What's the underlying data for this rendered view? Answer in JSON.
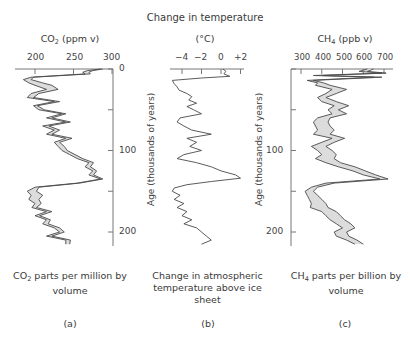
{
  "header": {
    "title": "Change in temperature"
  },
  "panels": [
    {
      "id": "a",
      "axis_title_main": "CO",
      "axis_title_sub": "2",
      "axis_title_rest": " (ppm v)",
      "ticks": [
        "200",
        "250",
        "300"
      ],
      "caption_main": "CO",
      "caption_sub": "2",
      "caption_rest": " parts per million by volume",
      "letter": "(a)"
    },
    {
      "id": "b",
      "axis_title_main": "(°C)",
      "ticks": [
        "−4",
        "−2",
        "0",
        "+2"
      ],
      "caption_main": "Change in atmospheric temperature above ice sheet",
      "letter": "(b)"
    },
    {
      "id": "c",
      "axis_title_main": "CH",
      "axis_title_sub": "4",
      "axis_title_rest": " (ppb v)",
      "ticks": [
        "300",
        "400",
        "500",
        "600",
        "700"
      ],
      "caption_main": "CH",
      "caption_sub": "4",
      "caption_rest": " parts per billion by volume",
      "letter": "(c)"
    }
  ],
  "age_axis": {
    "label": "Age (thousands of years)",
    "ticks": [
      "0",
      "100",
      "200"
    ]
  },
  "colors": {
    "line": "#4a4a4a",
    "band_fill": "#dcdcdc",
    "axis": "#777777"
  },
  "chart_data": [
    {
      "type": "line",
      "title": "CO2 (ppm v)",
      "xlabel": "CO2 parts per million by volume",
      "ylabel": "Age (thousands of years)",
      "xlim": [
        170,
        300
      ],
      "ylim": [
        220,
        0
      ],
      "x_ticks": [
        200,
        250,
        300
      ],
      "y_ticks": [
        0,
        50,
        100,
        150,
        200
      ],
      "series": [
        {
          "name": "CO2 lower",
          "age": [
            0,
            2,
            4,
            6,
            10,
            13,
            17,
            20,
            25,
            30,
            35,
            40,
            45,
            50,
            55,
            60,
            65,
            70,
            75,
            80,
            85,
            90,
            95,
            100,
            105,
            110,
            115,
            120,
            125,
            130,
            135,
            140,
            145,
            150,
            155,
            160,
            165,
            170,
            175,
            180,
            185,
            190,
            195,
            200,
            205,
            210,
            215
          ],
          "values": [
            285,
            268,
            262,
            265,
            195,
            185,
            192,
            200,
            215,
            195,
            190,
            225,
            198,
            205,
            235,
            215,
            240,
            210,
            225,
            215,
            240,
            225,
            230,
            235,
            245,
            255,
            270,
            265,
            275,
            270,
            285,
            255,
            200,
            190,
            195,
            192,
            200,
            196,
            215,
            200,
            215,
            210,
            225,
            232,
            215,
            240,
            240
          ]
        },
        {
          "name": "CO2 upper",
          "age": [
            0,
            2,
            4,
            6,
            10,
            13,
            17,
            20,
            25,
            30,
            35,
            40,
            45,
            50,
            55,
            60,
            65,
            70,
            75,
            80,
            85,
            90,
            95,
            100,
            105,
            110,
            115,
            120,
            125,
            130,
            135,
            140,
            145,
            150,
            155,
            160,
            165,
            170,
            175,
            180,
            185,
            190,
            195,
            200,
            205,
            210,
            215
          ],
          "values": [
            288,
            275,
            270,
            272,
            198,
            195,
            210,
            222,
            230,
            205,
            198,
            232,
            203,
            212,
            240,
            222,
            246,
            218,
            232,
            222,
            248,
            232,
            238,
            242,
            252,
            262,
            276,
            272,
            280,
            276,
            288,
            258,
            205,
            202,
            210,
            205,
            208,
            202,
            222,
            206,
            220,
            217,
            232,
            238,
            222,
            246,
            245
          ]
        }
      ]
    },
    {
      "type": "line",
      "title": "Change in temperature (°C)",
      "xlabel": "Change in atmospheric temperature above ice sheet",
      "ylabel": "Age (thousands of years)",
      "xlim": [
        -5,
        2.5
      ],
      "ylim": [
        220,
        0
      ],
      "x_ticks": [
        -4,
        -2,
        0,
        2
      ],
      "y_ticks": [
        0,
        50,
        100,
        150,
        200
      ],
      "series": [
        {
          "name": "Temperature change",
          "age": [
            0,
            3,
            6,
            9,
            11,
            14,
            18,
            22,
            26,
            30,
            34,
            38,
            42,
            46,
            50,
            55,
            60,
            65,
            70,
            75,
            80,
            85,
            90,
            95,
            100,
            105,
            110,
            115,
            120,
            125,
            130,
            134,
            138,
            142,
            146,
            150,
            155,
            160,
            165,
            170,
            175,
            180,
            185,
            190,
            195,
            200,
            205,
            210,
            215
          ],
          "values": [
            0.2,
            0.5,
            0.3,
            0.9,
            -2.0,
            -5.0,
            -4.8,
            -4.5,
            -4.3,
            -3.5,
            -3.0,
            -3.3,
            -2.5,
            -3.5,
            -2.8,
            -2.0,
            -4.2,
            -4.5,
            -3.8,
            -3.0,
            -1.0,
            -3.5,
            -2.5,
            -3.2,
            -2.0,
            -3.8,
            -4.5,
            -2.5,
            -1.0,
            0.0,
            1.5,
            2.0,
            -1.0,
            -3.5,
            -4.8,
            -5.0,
            -4.2,
            -4.8,
            -3.8,
            -4.5,
            -3.5,
            -4.0,
            -3.0,
            -3.8,
            -2.5,
            -2.0,
            -1.5,
            -1.0,
            -2.0
          ]
        }
      ]
    },
    {
      "type": "line",
      "title": "CH4 (ppb v)",
      "xlabel": "CH4 parts per billion by volume",
      "ylabel": "Age (thousands of years)",
      "xlim": [
        250,
        740
      ],
      "ylim": [
        220,
        0
      ],
      "x_ticks": [
        300,
        400,
        500,
        600,
        700
      ],
      "y_ticks": [
        0,
        50,
        100,
        150,
        200
      ],
      "series": [
        {
          "name": "CH4 lower",
          "age": [
            0,
            3,
            5,
            8,
            10,
            14,
            17,
            20,
            25,
            30,
            35,
            40,
            45,
            50,
            55,
            60,
            65,
            70,
            75,
            80,
            85,
            90,
            95,
            100,
            105,
            110,
            115,
            120,
            125,
            130,
            135,
            140,
            145,
            150,
            155,
            160,
            165,
            170,
            175,
            180,
            185,
            190,
            195,
            200,
            205,
            210,
            215
          ],
          "values": [
            620,
            580,
            690,
            360,
            650,
            330,
            380,
            370,
            450,
            420,
            380,
            400,
            460,
            430,
            450,
            380,
            360,
            370,
            380,
            360,
            450,
            400,
            350,
            380,
            400,
            370,
            420,
            480,
            550,
            600,
            680,
            420,
            350,
            320,
            330,
            340,
            350,
            345,
            400,
            420,
            440,
            470,
            500,
            460,
            470,
            520,
            560
          ]
        },
        {
          "name": "CH4 upper",
          "age": [
            0,
            3,
            5,
            8,
            10,
            14,
            17,
            20,
            25,
            30,
            35,
            40,
            45,
            50,
            55,
            60,
            65,
            70,
            75,
            80,
            85,
            90,
            95,
            100,
            105,
            110,
            115,
            120,
            125,
            130,
            135,
            140,
            145,
            150,
            155,
            160,
            165,
            170,
            175,
            180,
            185,
            190,
            195,
            200,
            205,
            210,
            215
          ],
          "values": [
            650,
            620,
            710,
            400,
            690,
            360,
            410,
            440,
            520,
            470,
            420,
            470,
            530,
            480,
            520,
            440,
            430,
            440,
            460,
            440,
            510,
            460,
            420,
            450,
            470,
            460,
            490,
            560,
            610,
            660,
            720,
            460,
            380,
            360,
            380,
            400,
            420,
            430,
            470,
            490,
            510,
            540,
            560,
            520,
            530,
            570,
            600
          ]
        }
      ]
    }
  ]
}
